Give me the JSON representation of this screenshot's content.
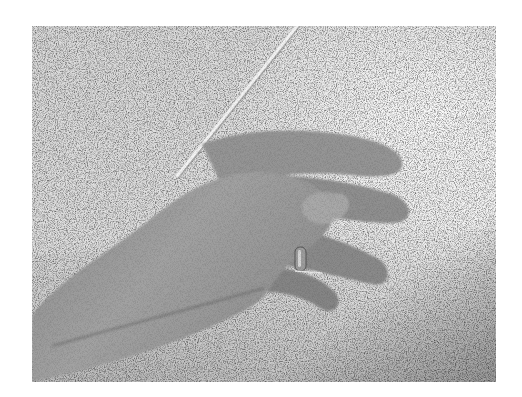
{
  "image": {
    "kind": "photograph",
    "colorspace": "grayscale",
    "description": "Close-up of a relaxed right hand resting on a speckled countertop, wearing a ring, with a thin rod/stick resting across the hand",
    "subjects": [
      "hand",
      "ring",
      "rod",
      "speckled countertop"
    ],
    "frame": {
      "x": 32,
      "y": 26,
      "width": 464,
      "height": 356
    },
    "colors": {
      "page_background": "#ffffff",
      "surface_light": "#e6e6e6",
      "surface_dark": "#a8a8a8",
      "skin_light": "#b4b4b4",
      "skin_mid": "#8e8e8e",
      "skin_dark": "#6a6a6a",
      "rod": "#f0f0f0",
      "ring": "#9a9a9a"
    }
  }
}
